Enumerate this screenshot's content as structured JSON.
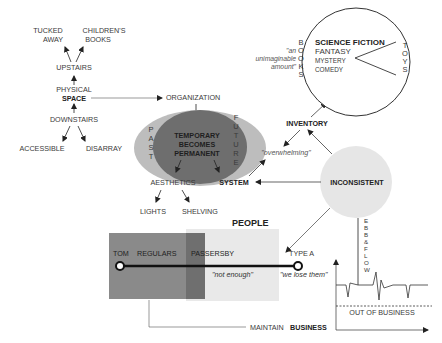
{
  "diagram": {
    "space_tree": {
      "top_left": [
        "TUCKED",
        "AWAY"
      ],
      "top_right": [
        "CHILDREN'S",
        "BOOKS"
      ],
      "upstairs": "UPSTAIRS",
      "physical": "PHYSICAL",
      "space": "SPACE",
      "downstairs": "DOWNSTAIRS",
      "accessible": "ACCESSIBLE",
      "disarray": "DISARRAY"
    },
    "organization": "ORGANIZATION",
    "time_ellipse": {
      "past": [
        "P",
        "A",
        "S",
        "T"
      ],
      "future": [
        "F",
        "U",
        "T",
        "U",
        "R",
        "E"
      ],
      "center": [
        "TEMPORARY",
        "BECOMES",
        "PERMANENT"
      ]
    },
    "aesthetics": "AESTHETICS",
    "lights": "LIGHTS",
    "shelving": "SHELVING",
    "system": "SYSTEM",
    "overwhelming": "\"overwhelming\"",
    "inventory": "INVENTORY",
    "inconsistent": "INCONSISTENT",
    "pie": {
      "genres": [
        "SCIENCE FICTION",
        "FANTASY",
        "MYSTERY",
        "COMEDY"
      ],
      "books_label": [
        "B",
        "O",
        "O",
        "K",
        "S"
      ],
      "toys_label": [
        "T",
        "O",
        "Y",
        "S"
      ],
      "quote": [
        "\"an",
        "unimaginable",
        "amount\""
      ]
    },
    "people": {
      "title": "PEOPLE",
      "tom": "TOM",
      "regulars": "REGULARS",
      "passersby": "PASSERSBY",
      "type_a": "TYPE A",
      "not_enough": "\"not enough\"",
      "we_lose_them": "\"we lose them\""
    },
    "ebb_flow": [
      "E",
      "B",
      "B",
      "&",
      "F",
      "L",
      "O",
      "W"
    ],
    "out_of_business": "OUT OF BUSINESS",
    "maintain": "MAINTAIN",
    "business": "BUSINESS",
    "colors": {
      "ellipse_outer": "#bdbdbd",
      "ellipse_inner": "#6e6e6e",
      "rect_dark": "#8a8a8a",
      "rect_light": "#e9e9e9",
      "circle_inconsistent": "#e6e6e6"
    }
  }
}
